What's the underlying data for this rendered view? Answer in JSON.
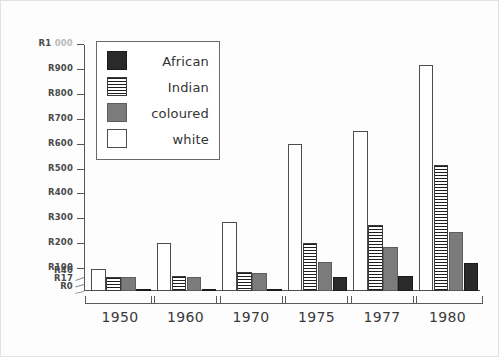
{
  "chart_data": {
    "type": "bar",
    "title": "",
    "subtitle": "",
    "xlabel": "",
    "ylabel": "",
    "categories": [
      "1950",
      "1960",
      "1970",
      "1975",
      "1977",
      "1980"
    ],
    "series": [
      {
        "name": "white",
        "swatch": "white",
        "color": "#ffffff",
        "values": [
          100,
          206,
          288,
          605,
          655,
          920
        ]
      },
      {
        "name": "Indian",
        "swatch": "indian",
        "color": "#1f1f1f",
        "values": [
          40,
          45,
          80,
          205,
          275,
          520
        ]
      },
      {
        "name": "coloured",
        "swatch": "coloured",
        "color": "#7b7b7b",
        "values": [
          40,
          40,
          72,
          130,
          190,
          250
        ]
      },
      {
        "name": "African",
        "swatch": "african",
        "color": "#2a2a2a",
        "values": [
          4,
          5,
          6,
          40,
          45,
          125
        ]
      }
    ],
    "legend_entries": [
      "African",
      "Indian",
      "coloured",
      "white"
    ],
    "legend_position": "top-left",
    "grid": false,
    "axis_type": "non-linear-compressed-base",
    "ylim": [
      0,
      1000
    ],
    "yticks": [
      {
        "label": "R1 000",
        "value": 1000
      },
      {
        "label": "R900",
        "value": 900
      },
      {
        "label": "R800",
        "value": 800
      },
      {
        "label": "R700",
        "value": 700
      },
      {
        "label": "R600",
        "value": 600
      },
      {
        "label": "R500",
        "value": 500
      },
      {
        "label": "R400",
        "value": 400
      },
      {
        "label": "R300",
        "value": 300
      },
      {
        "label": "R200",
        "value": 200
      },
      {
        "label": "R100",
        "value": 100
      },
      {
        "label": "R40",
        "value": 40
      },
      {
        "label": "R17",
        "value": 17
      },
      {
        "label": "R0",
        "value": 0
      }
    ]
  },
  "axis": {
    "top_label_prefix": "R1",
    "top_label_suffix": "000"
  }
}
